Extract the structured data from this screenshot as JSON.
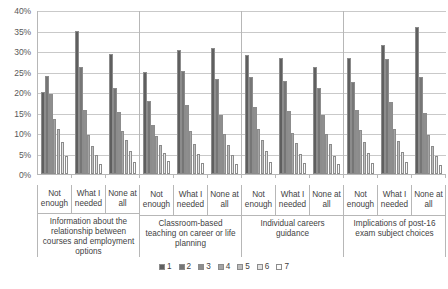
{
  "chart_data": {
    "type": "bar",
    "title": "",
    "subtitle": "",
    "xlabel": "",
    "ylabel": "",
    "ylim": [
      0,
      0.4
    ],
    "grid": true,
    "legend_position": "bottom",
    "y_ticks": [
      "0%",
      "5%",
      "10%",
      "15%",
      "20%",
      "25%",
      "30%",
      "35%",
      "40%"
    ],
    "y_tick_values": [
      0,
      5,
      10,
      15,
      20,
      25,
      30,
      35,
      40
    ],
    "legend": [
      "1",
      "2",
      "3",
      "4",
      "5",
      "6",
      "7"
    ],
    "series_colors": [
      "#5f5f5f",
      "#767676",
      "#8e8e8e",
      "#a5a5a5",
      "#bdbdbd",
      "#e2e2e2",
      "#fbfbfb"
    ],
    "categories": [
      "Information about the relationship between courses and employment options",
      "Classroom-based teaching on career or life planning",
      "Individual careers guidance",
      "Implications of post-16 exam subject choices"
    ],
    "subcategories": [
      "Not enough",
      "What I needed",
      "None at all"
    ],
    "groups": [
      {
        "category": "Information about the relationship between courses and employment options",
        "bars": [
          {
            "subcategory": "Not enough",
            "values": [
              20.0,
              23.9,
              19.6,
              13.3,
              10.9,
              7.8,
              4.5
            ]
          },
          {
            "subcategory": "What I needed",
            "values": [
              34.8,
              26.1,
              15.6,
              9.4,
              6.9,
              4.6,
              2.4
            ]
          },
          {
            "subcategory": "None at all",
            "values": [
              29.3,
              20.9,
              15.2,
              10.6,
              8.4,
              5.6,
              3.0
            ]
          }
        ]
      },
      {
        "category": "Classroom-based teaching on career or life planning",
        "bars": [
          {
            "subcategory": "Not enough",
            "values": [
              24.8,
              17.9,
              12.0,
              9.2,
              7.1,
              5.2,
              3.1
            ]
          },
          {
            "subcategory": "What I needed",
            "values": [
              30.2,
              25.1,
              16.8,
              10.4,
              7.4,
              5.0,
              2.6
            ]
          },
          {
            "subcategory": "None at all",
            "values": [
              30.7,
              23.2,
              14.5,
              9.7,
              7.0,
              4.6,
              2.5
            ]
          }
        ]
      },
      {
        "category": "Individual careers guidance",
        "bars": [
          {
            "subcategory": "Not enough",
            "values": [
              29.0,
              23.7,
              16.4,
              11.1,
              8.3,
              5.5,
              3.0
            ]
          },
          {
            "subcategory": "What I needed",
            "values": [
              28.4,
              22.6,
              15.3,
              10.0,
              7.5,
              4.8,
              2.7
            ]
          },
          {
            "subcategory": "None at all",
            "values": [
              26.2,
              21.0,
              14.4,
              9.8,
              7.2,
              4.4,
              2.4
            ]
          }
        ]
      },
      {
        "category": "Implications of post-16 exam subject choices",
        "bars": [
          {
            "subcategory": "Not enough",
            "values": [
              28.2,
              22.4,
              15.7,
              10.7,
              7.9,
              5.2,
              2.8
            ]
          },
          {
            "subcategory": "What I needed",
            "values": [
              31.5,
              28.0,
              17.5,
              11.0,
              8.0,
              5.3,
              2.9
            ]
          },
          {
            "subcategory": "None at all",
            "values": [
              35.8,
              23.6,
              14.9,
              9.6,
              6.8,
              4.4,
              2.3
            ]
          }
        ]
      }
    ]
  }
}
